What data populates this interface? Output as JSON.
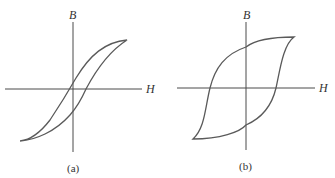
{
  "figures": [
    {
      "id": "a",
      "caption": "(a)",
      "x_axis_label": "H",
      "y_axis_label": "B",
      "loop_type": "narrow hysteresis loop"
    },
    {
      "id": "b",
      "caption": "(b)",
      "x_axis_label": "H",
      "y_axis_label": "B",
      "loop_type": "wide hysteresis loop"
    }
  ]
}
